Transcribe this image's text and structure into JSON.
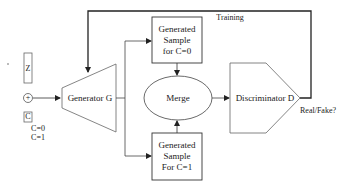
{
  "diagram": {
    "type": "flowchart",
    "inputs": {
      "z_label": "Z",
      "concat_symbol": "+",
      "c_label": "C",
      "c_values": [
        "C=0",
        "C=1"
      ]
    },
    "nodes": {
      "generator": "Generator G",
      "sample_c0": {
        "line1": "Generated",
        "line2": "Sample",
        "line3": "for C=0"
      },
      "sample_c1": {
        "line1": "Generated",
        "line2": "Sample",
        "line3": "For C=1"
      },
      "merge": "Merge",
      "discriminator": "Discriminator D"
    },
    "edges": {
      "training_label": "Training",
      "output_label": "Real/Fake?"
    },
    "colors": {
      "stroke": "#333333",
      "shape_stroke": "#555555",
      "background": "#ffffff"
    }
  }
}
